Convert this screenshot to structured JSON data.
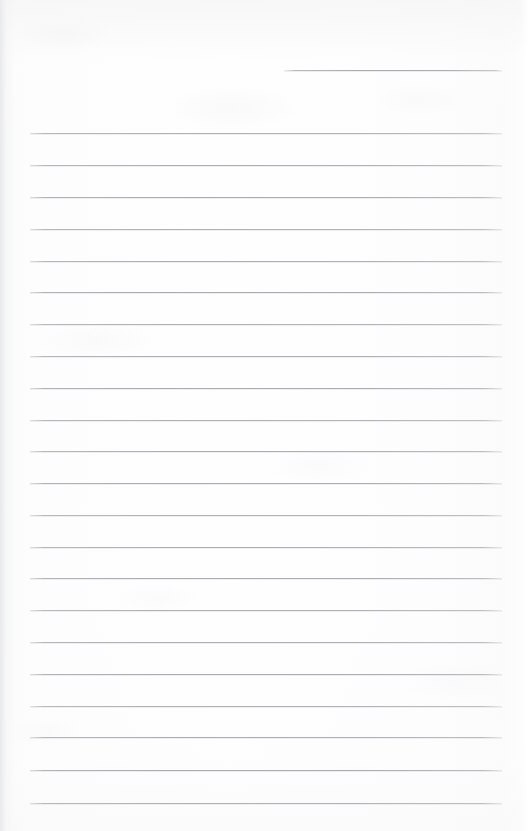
{
  "document": {
    "kind": "scanned-ruled-notebook-page",
    "title": "Blank Ruled Page",
    "page_width": 528,
    "page_height": 831,
    "content_text": "",
    "handwriting_present": "none",
    "colors": {
      "paper": "#fdfdfd",
      "paper_edge": "#f2f3f4",
      "rule_line": "#a8acb0",
      "rule_line_faded": "#c4c7ca"
    }
  },
  "ruling": {
    "rule_left_x": 30,
    "rule_right_x": 502,
    "rule_thickness": 1,
    "line_spacing": 31.8,
    "full_rule_count": 22,
    "first_rule_y": 133,
    "last_rule_y": 803
  },
  "header_rule": {
    "label": "header-short-rule",
    "x": 284,
    "y": 70,
    "width": 218,
    "text": ""
  },
  "rules": [
    {
      "y": 133
    },
    {
      "y": 165
    },
    {
      "y": 197
    },
    {
      "y": 229
    },
    {
      "y": 261
    },
    {
      "y": 292
    },
    {
      "y": 324
    },
    {
      "y": 356
    },
    {
      "y": 388
    },
    {
      "y": 420
    },
    {
      "y": 451
    },
    {
      "y": 483
    },
    {
      "y": 515
    },
    {
      "y": 547
    },
    {
      "y": 578
    },
    {
      "y": 610
    },
    {
      "y": 642
    },
    {
      "y": 674
    },
    {
      "y": 706
    },
    {
      "y": 737
    },
    {
      "y": 770
    },
    {
      "y": 803
    }
  ]
}
